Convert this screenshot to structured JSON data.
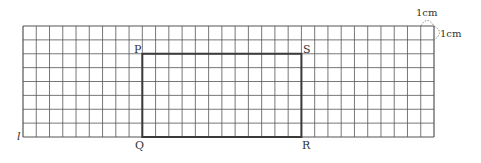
{
  "diagram": {
    "grid": {
      "columns": 31,
      "rows": 8,
      "unit_label_h": "1cm",
      "unit_label_v": "1cm"
    },
    "line_label": "l",
    "rectangle": {
      "vertices": {
        "P": {
          "col": 9,
          "row": 2
        },
        "S": {
          "col": 21,
          "row": 2
        },
        "Q": {
          "col": 9,
          "row": 8
        },
        "R": {
          "col": 21,
          "row": 8
        }
      },
      "labels": {
        "P": "P",
        "Q": "Q",
        "R": "R",
        "S": "S"
      },
      "width_cells": 12,
      "height_cells": 6
    },
    "colors": {
      "grid": "#555555",
      "rect": "#3a3a3a",
      "text": "#333333"
    }
  }
}
